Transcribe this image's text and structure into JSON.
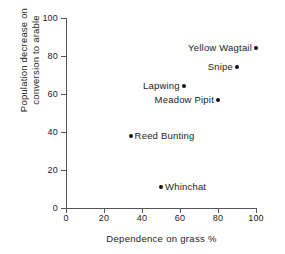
{
  "chart_data": {
    "type": "scatter",
    "title": "",
    "xlabel": "Dependence on grass %",
    "ylabel_line1": "Population decrease on",
    "ylabel_line2": "conversion to arable",
    "xlim": [
      0,
      100
    ],
    "ylim": [
      0,
      100
    ],
    "xticks": [
      0,
      20,
      40,
      60,
      80,
      100
    ],
    "yticks": [
      0,
      20,
      40,
      60,
      80,
      100
    ],
    "grid": false,
    "legend": "none",
    "marker_color": "#111111",
    "axis_color": "#555555",
    "points": [
      {
        "label": "Yellow Wagtail",
        "x": 100,
        "y": 84,
        "label_side": "left"
      },
      {
        "label": "Snipe",
        "x": 90,
        "y": 74,
        "label_side": "left"
      },
      {
        "label": "Lapwing",
        "x": 62,
        "y": 64,
        "label_side": "left"
      },
      {
        "label": "Meadow Pipit",
        "x": 80,
        "y": 57,
        "label_side": "left"
      },
      {
        "label": "Reed Bunting",
        "x": 34,
        "y": 38,
        "label_side": "right"
      },
      {
        "label": "Whinchat",
        "x": 50,
        "y": 11,
        "label_side": "right"
      }
    ]
  }
}
